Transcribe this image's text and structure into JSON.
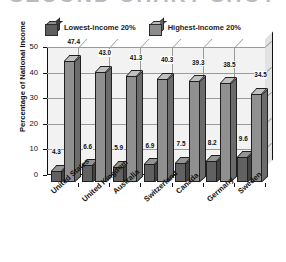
{
  "title": "SECOND CHART SHOT",
  "legend": {
    "position": "top-center",
    "entries": [
      {
        "label": "Lowest-income 20%",
        "color": "#616161",
        "icon": "cube-swatch-icon"
      },
      {
        "label": "Highest-income 20%",
        "color": "#909090",
        "icon": "cube-swatch-icon"
      }
    ]
  },
  "axes": {
    "ylabel": "Percentage of National Income",
    "xlabel": "",
    "yticks": [
      "50",
      "40",
      "30",
      "20",
      "10",
      "0"
    ]
  },
  "chart_data": {
    "type": "bar",
    "title": "SECOND CHART SHOT",
    "xlabel": "",
    "ylabel": "Percentage of National Income",
    "ylim": [
      0,
      50
    ],
    "ytick_step": 10,
    "grid": true,
    "legend_position": "top-center",
    "style": "3d-grouped-columns",
    "categories": [
      "United States",
      "United Kingdom",
      "Australia",
      "Switzerland",
      "Canada",
      "Germany",
      "Sweden"
    ],
    "series": [
      {
        "name": "Lowest-income 20%",
        "color": "#616161",
        "values": [
          4.3,
          6.6,
          5.9,
          6.9,
          7.5,
          8.2,
          9.6
        ],
        "labels": [
          "4.3",
          "6.6",
          "5.9",
          "6.9",
          "7.5",
          "8.2",
          "9.6"
        ]
      },
      {
        "name": "Highest-income 20%",
        "color": "#909090",
        "values": [
          47.4,
          43.0,
          41.3,
          40.3,
          39.3,
          38.5,
          34.5
        ],
        "labels": [
          "47.4",
          "43.0",
          "41.3",
          "40.3",
          "39.3",
          "38.5",
          "34.5"
        ]
      }
    ]
  }
}
